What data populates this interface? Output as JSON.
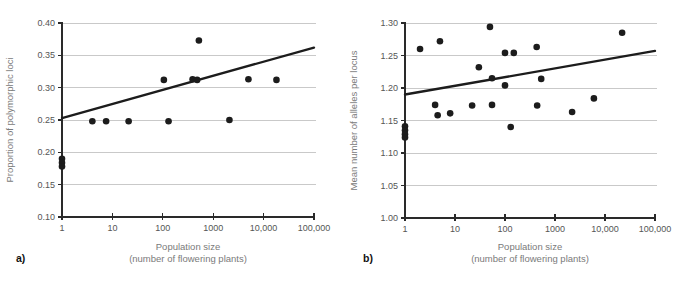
{
  "figure": {
    "background": "#ffffff",
    "colors": {
      "point": "#1c1c1c",
      "trend": "#1c1c1c",
      "grid": "#c9c9c9",
      "axis": "#2a2a2a",
      "tick_label": "#555555",
      "axis_title": "#7a7a7a",
      "panel_label": "#111111"
    }
  },
  "chart_data": [
    {
      "type": "scatter",
      "panel_label": "a)",
      "ylabel": "Proportion of polymorphic loci",
      "xlabel_line1": "Population size",
      "xlabel_line2": "(number of flowering plants)",
      "x_scale": "log",
      "xlim": [
        1,
        100000
      ],
      "ylim": [
        0.1,
        0.4
      ],
      "grid": true,
      "x_ticks": [
        {
          "value": 1,
          "label": "1"
        },
        {
          "value": 10,
          "label": "10"
        },
        {
          "value": 100,
          "label": "100"
        },
        {
          "value": 1000,
          "label": "1000"
        },
        {
          "value": 10000,
          "label": "10,000"
        },
        {
          "value": 100000,
          "label": "100,000"
        }
      ],
      "y_ticks": [
        {
          "value": 0.1,
          "label": "0.10"
        },
        {
          "value": 0.15,
          "label": "0.15"
        },
        {
          "value": 0.2,
          "label": "0.20"
        },
        {
          "value": 0.25,
          "label": "0.25"
        },
        {
          "value": 0.3,
          "label": "0.30"
        },
        {
          "value": 0.35,
          "label": "0.35"
        },
        {
          "value": 0.4,
          "label": "0.40"
        }
      ],
      "points": [
        [
          1,
          0.19
        ],
        [
          1,
          0.184
        ],
        [
          1,
          0.178
        ],
        [
          4,
          0.248
        ],
        [
          7.5,
          0.248
        ],
        [
          21,
          0.248
        ],
        [
          105,
          0.312
        ],
        [
          130,
          0.248
        ],
        [
          390,
          0.313
        ],
        [
          480,
          0.312
        ],
        [
          520,
          0.373
        ],
        [
          2100,
          0.25
        ],
        [
          5000,
          0.313
        ],
        [
          18000,
          0.312
        ]
      ],
      "trend": {
        "x1": 1,
        "y1": 0.253,
        "x2": 100000,
        "y2": 0.362
      }
    },
    {
      "type": "scatter",
      "panel_label": "b)",
      "ylabel": "Mean number of alleles per locus",
      "xlabel_line1": "Population size",
      "xlabel_line2": "(number of flowering plants)",
      "x_scale": "log",
      "xlim": [
        1,
        100000
      ],
      "ylim": [
        1.0,
        1.3
      ],
      "grid": true,
      "x_ticks": [
        {
          "value": 1,
          "label": "1"
        },
        {
          "value": 10,
          "label": "10"
        },
        {
          "value": 100,
          "label": "100"
        },
        {
          "value": 1000,
          "label": "1000"
        },
        {
          "value": 10000,
          "label": "10,000"
        },
        {
          "value": 100000,
          "label": "100,000"
        }
      ],
      "y_ticks": [
        {
          "value": 1.0,
          "label": "1.00"
        },
        {
          "value": 1.05,
          "label": "1.05"
        },
        {
          "value": 1.1,
          "label": "1.10"
        },
        {
          "value": 1.15,
          "label": "1.15"
        },
        {
          "value": 1.2,
          "label": "1.20"
        },
        {
          "value": 1.25,
          "label": "1.25"
        },
        {
          "value": 1.3,
          "label": "1.30"
        }
      ],
      "points": [
        [
          1,
          1.141
        ],
        [
          1,
          1.135
        ],
        [
          1,
          1.129
        ],
        [
          1,
          1.124
        ],
        [
          2,
          1.26
        ],
        [
          4,
          1.174
        ],
        [
          4.5,
          1.158
        ],
        [
          5,
          1.272
        ],
        [
          8,
          1.161
        ],
        [
          22,
          1.173
        ],
        [
          30,
          1.232
        ],
        [
          50,
          1.294
        ],
        [
          55,
          1.215
        ],
        [
          55,
          1.174
        ],
        [
          100,
          1.254
        ],
        [
          100,
          1.204
        ],
        [
          130,
          1.14
        ],
        [
          150,
          1.254
        ],
        [
          430,
          1.263
        ],
        [
          440,
          1.173
        ],
        [
          530,
          1.214
        ],
        [
          2200,
          1.163
        ],
        [
          6000,
          1.184
        ],
        [
          22000,
          1.285
        ]
      ],
      "trend": {
        "x1": 1,
        "y1": 1.19,
        "x2": 100000,
        "y2": 1.257
      }
    }
  ]
}
